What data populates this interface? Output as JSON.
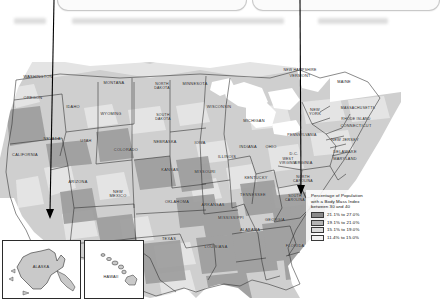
{
  "window": {
    "background_color": "#ffffff",
    "cards": [
      {
        "name": "left-card",
        "label": ""
      },
      {
        "name": "right-card",
        "label": ""
      }
    ],
    "placeholder_bars": [
      {
        "x": 14,
        "y": 18,
        "w": 32
      },
      {
        "x": 72,
        "y": 18,
        "w": 212
      },
      {
        "x": 318,
        "y": 18,
        "w": 70
      }
    ]
  },
  "annotations": {
    "leader_lines": [
      {
        "name": "leader-line-left",
        "x1": 54,
        "y1": 0,
        "x2": 50,
        "y2": 216,
        "target": "Arizona-California border"
      },
      {
        "name": "leader-line-right",
        "x1": 300,
        "y1": 0,
        "x2": 301,
        "y2": 192,
        "target": "South Carolina"
      }
    ]
  },
  "map": {
    "title": "United States choropleth map",
    "ocean_color": "#ffffff",
    "land_color": "#cfcfcf",
    "border_color": "#2b2b2b",
    "states": [
      {
        "name": "WASHINGTON",
        "label": "WASHINGTON",
        "x": 38,
        "y": 75,
        "shade": 2
      },
      {
        "name": "OREGON",
        "label": "OREGON",
        "x": 33,
        "y": 96,
        "shade": 3
      },
      {
        "name": "IDAHO",
        "label": "IDAHO",
        "x": 73,
        "y": 105,
        "shade": 3
      },
      {
        "name": "MONTANA",
        "label": "MONTANA",
        "x": 114,
        "y": 81,
        "shade": 2
      },
      {
        "name": "WYOMING",
        "label": "WYOMING",
        "x": 111,
        "y": 112,
        "shade": 2
      },
      {
        "name": "NEVADA",
        "label": "NEVADA",
        "x": 52,
        "y": 137,
        "shade": 1
      },
      {
        "name": "UTAH",
        "label": "UTAH",
        "x": 86,
        "y": 139,
        "shade": 2
      },
      {
        "name": "CALIFORNIA",
        "label": "CALIFORNIA",
        "x": 25,
        "y": 153,
        "shade": 1
      },
      {
        "name": "ARIZONA",
        "label": "ARIZONA",
        "x": 78,
        "y": 180,
        "shade": 2
      },
      {
        "name": "NEW MEXICO",
        "label": "NEW\nMEXICO",
        "x": 118,
        "y": 190,
        "shade": 2
      },
      {
        "name": "COLORADO",
        "label": "COLORADO",
        "x": 126,
        "y": 148,
        "shade": 1
      },
      {
        "name": "NORTH DAKOTA",
        "label": "NORTH\nDAKOTA",
        "x": 162,
        "y": 82,
        "shade": 3
      },
      {
        "name": "SOUTH DAKOTA",
        "label": "SOUTH\nDAKOTA",
        "x": 163,
        "y": 113,
        "shade": 3
      },
      {
        "name": "NEBRASKA",
        "label": "NEBRASKA",
        "x": 165,
        "y": 140,
        "shade": 3
      },
      {
        "name": "KANSAS",
        "label": "KANSAS",
        "x": 170,
        "y": 168,
        "shade": 3
      },
      {
        "name": "MINNESOTA",
        "label": "MINNESOTA",
        "x": 195,
        "y": 82,
        "shade": 2
      },
      {
        "name": "IOWA",
        "label": "IOWA",
        "x": 200,
        "y": 141,
        "shade": 3
      },
      {
        "name": "MISSOURI",
        "label": "MISSOURI",
        "x": 205,
        "y": 170,
        "shade": 4
      },
      {
        "name": "OKLAHOMA",
        "label": "OKLAHOMA",
        "x": 177,
        "y": 200,
        "shade": 4
      },
      {
        "name": "TEXAS",
        "label": "TEXAS",
        "x": 169,
        "y": 237,
        "shade": 3
      },
      {
        "name": "ARKANSAS",
        "label": "ARKANSAS",
        "x": 213,
        "y": 203,
        "shade": 4
      },
      {
        "name": "LOUISIANA",
        "label": "LOUISIANA",
        "x": 216,
        "y": 245,
        "shade": 4
      },
      {
        "name": "WISCONSIN",
        "label": "WISCONSIN",
        "x": 219,
        "y": 105,
        "shade": 2
      },
      {
        "name": "MICHIGAN",
        "label": "MICHIGAN",
        "x": 254,
        "y": 119,
        "shade": 3
      },
      {
        "name": "ILLINOIS",
        "label": "ILLINOIS",
        "x": 227,
        "y": 155,
        "shade": 3
      },
      {
        "name": "INDIANA",
        "label": "INDIANA",
        "x": 248,
        "y": 145,
        "shade": 4
      },
      {
        "name": "OHIO",
        "label": "OHIO",
        "x": 271,
        "y": 145,
        "shade": 4
      },
      {
        "name": "KENTUCKY",
        "label": "KENTUCKY",
        "x": 256,
        "y": 176,
        "shade": 4
      },
      {
        "name": "TENNESSEE",
        "label": "TENNESSEE",
        "x": 253,
        "y": 193,
        "shade": 4
      },
      {
        "name": "MISSISSIPPI",
        "label": "MISSISSIPPI",
        "x": 231,
        "y": 216,
        "shade": 4
      },
      {
        "name": "ALABAMA",
        "label": "ALABAMA",
        "x": 250,
        "y": 228,
        "shade": 4
      },
      {
        "name": "GEORGIA",
        "label": "GEORGIA",
        "x": 275,
        "y": 218,
        "shade": 4
      },
      {
        "name": "FLORIDA",
        "label": "FLORIDA",
        "x": 295,
        "y": 244,
        "shade": 3
      },
      {
        "name": "SOUTH CAROLINA",
        "label": "SOUTH\nCAROLINA",
        "x": 295,
        "y": 194,
        "shade": 4
      },
      {
        "name": "NORTH CAROLINA",
        "label": "NORTH\nCAROLINA",
        "x": 303,
        "y": 175,
        "shade": 4
      },
      {
        "name": "WEST VIRGINIA",
        "label": "WEST\nVIRGINIA",
        "x": 288,
        "y": 157,
        "shade": 4
      },
      {
        "name": "VIRGINIA",
        "label": "VIRGINIA",
        "x": 303,
        "y": 161,
        "shade": 3
      },
      {
        "name": "PENNSYLVANIA",
        "label": "PENNSYLVANIA",
        "x": 302,
        "y": 133,
        "shade": 3
      },
      {
        "name": "NEW YORK",
        "label": "NEW\nYORK",
        "x": 315,
        "y": 108,
        "shade": 2
      },
      {
        "name": "NEW JERSEY",
        "label": "NEW JERSEY",
        "x": 345,
        "y": 138,
        "shade": 2
      },
      {
        "name": "DELAWARE",
        "label": "DELAWARE",
        "x": 345,
        "y": 150,
        "shade": 2
      },
      {
        "name": "MARYLAND",
        "label": "MARYLAND",
        "x": 345,
        "y": 157,
        "shade": 2
      },
      {
        "name": "D.C.",
        "label": "D.C.",
        "x": 294,
        "y": 152,
        "shade": 2
      },
      {
        "name": "MASSACHUSETTS",
        "label": "MASSACHUSETTS",
        "x": 358,
        "y": 106,
        "shade": 1
      },
      {
        "name": "RHODE ISLAND",
        "label": "RHODE ISLAND",
        "x": 356,
        "y": 117,
        "shade": 1
      },
      {
        "name": "CONNECTICUT",
        "label": "CONNECTICUT",
        "x": 356,
        "y": 124,
        "shade": 1
      },
      {
        "name": "NEW HAMPSHIRE",
        "label": "NEW HAMPSHIRE",
        "x": 300,
        "y": 68,
        "shade": 1
      },
      {
        "name": "VERMONT",
        "label": "VERMONT",
        "x": 300,
        "y": 74,
        "shade": 1
      },
      {
        "name": "MAINE",
        "label": "MAINE",
        "x": 344,
        "y": 80,
        "shade": 1
      }
    ],
    "insets": [
      {
        "name": "alaska-inset",
        "label": "ALASKA",
        "shade": 2
      },
      {
        "name": "hawaii-inset",
        "label": "HAWAII",
        "shade": 2
      }
    ]
  },
  "legend": {
    "title": "Percentage of Population\nwith a Body Mass Index\nbetween 30 and 40",
    "entries": [
      {
        "label": "21.1% to 27.0%",
        "color": "#8a8a8a"
      },
      {
        "label": "19.1% to 21.0%",
        "color": "#b4b4b4"
      },
      {
        "label": "15.1% to 19.0%",
        "color": "#dcdcdc"
      },
      {
        "label": "11.4% to 15.0%",
        "color": "#f2f2f2"
      }
    ]
  }
}
